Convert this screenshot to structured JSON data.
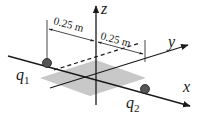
{
  "diagram": {
    "axes": {
      "x_label": "x",
      "y_label": "y",
      "z_label": "z"
    },
    "charges": {
      "q1": {
        "symbol": "q",
        "subscript": "1"
      },
      "q2": {
        "symbol": "q",
        "subscript": "2"
      }
    },
    "dimensions": {
      "left": "0.25 m",
      "right": "0.25 m"
    },
    "colors": {
      "line": "#1a1a1a",
      "plane": "#c8c8c8",
      "charge": "#555555"
    }
  }
}
